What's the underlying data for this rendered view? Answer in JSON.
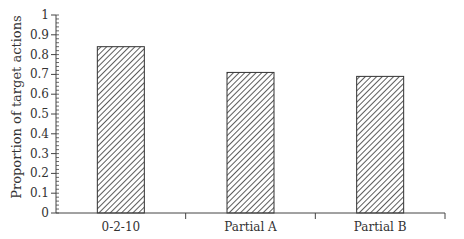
{
  "chart_data": {
    "type": "bar",
    "title": "",
    "xlabel": "",
    "ylabel": "Proportion of target actions",
    "categories": [
      "0-2-10",
      "Partial A",
      "Partial B"
    ],
    "values": [
      0.84,
      0.71,
      0.69
    ],
    "ylim": [
      0,
      1
    ],
    "yticks": [
      "0",
      "0.1",
      "0.2",
      "0.3",
      "0.4",
      "0.5",
      "0.6",
      "0.7",
      "0.8",
      "0.9",
      "1"
    ],
    "bar_pattern": "diagonal-hatch",
    "grid": false,
    "legend": null
  },
  "colors": {
    "axis": "#444444",
    "bar_stroke": "#333333",
    "hatch": "#333333",
    "background": "#ffffff"
  }
}
